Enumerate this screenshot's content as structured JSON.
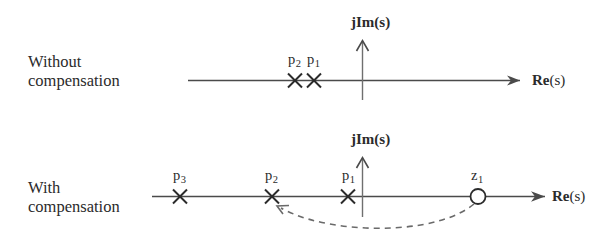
{
  "figure": {
    "type": "diagram",
    "background_color": "#ffffff",
    "ink_color": "#3a3a3a",
    "text_color": "#2b2b2b"
  },
  "panels": [
    {
      "id": "without-compensation",
      "row_label_line1": "Without",
      "row_label_line2": "compensation",
      "vertical_axis_label_bold": "jIm",
      "vertical_axis_label_plain": "(s)",
      "horizontal_axis_label_bold": "Re",
      "horizontal_axis_label_plain": "(s)",
      "markers": [
        {
          "name": "p",
          "subscript": "2",
          "kind": "pole",
          "glyph": "cross",
          "real_value": -1.45
        },
        {
          "name": "p",
          "subscript": "1",
          "kind": "pole",
          "glyph": "cross",
          "real_value": -0.75
        }
      ]
    },
    {
      "id": "with-compensation",
      "row_label_line1": "With",
      "row_label_line2": "compensation",
      "vertical_axis_label_bold": "jIm",
      "vertical_axis_label_plain": "(s)",
      "horizontal_axis_label_bold": "Re",
      "horizontal_axis_label_plain": "(s)",
      "markers": [
        {
          "name": "p",
          "subscript": "3",
          "kind": "pole",
          "glyph": "cross",
          "real_value": -2.2
        },
        {
          "name": "p",
          "subscript": "2",
          "kind": "pole",
          "glyph": "cross",
          "real_value": -1.45
        },
        {
          "name": "p",
          "subscript": "1",
          "kind": "pole",
          "glyph": "cross",
          "real_value": -0.75
        },
        {
          "name": "z",
          "subscript": "1",
          "kind": "zero",
          "glyph": "circle",
          "real_value": 0.95
        }
      ],
      "annotation": {
        "kind": "dashed-curved-arrow",
        "from_marker": "z1",
        "to_marker": "p2",
        "style": "dashed",
        "arrowhead": "open"
      }
    }
  ]
}
